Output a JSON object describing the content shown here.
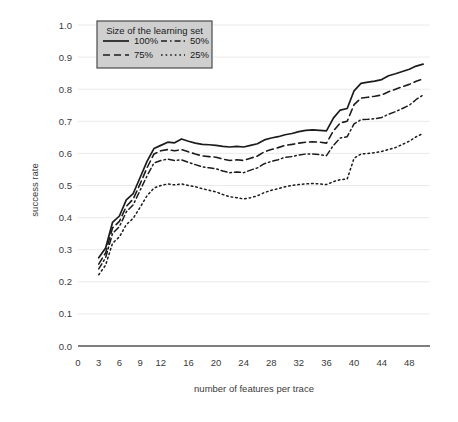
{
  "chart_data": {
    "type": "line",
    "title": "",
    "xlabel": "number of features per trace",
    "ylabel": "success rate",
    "xlim": [
      0,
      51
    ],
    "ylim": [
      0.0,
      1.0
    ],
    "grid": true,
    "legend_position": "top-left-inside",
    "legend_title": "Size of the learning set",
    "xtick_labels": [
      "0",
      "3",
      "6",
      "9",
      "12",
      "16",
      "20",
      "24",
      "28",
      "32",
      "36",
      "40",
      "44",
      "48"
    ],
    "xtick_values": [
      0,
      3,
      6,
      9,
      12,
      16,
      20,
      24,
      28,
      32,
      36,
      40,
      44,
      48
    ],
    "ytick_labels": [
      "0.0",
      "0.1",
      "0.2",
      "0.3",
      "0.4",
      "0.5",
      "0.6",
      "0.7",
      "0.8",
      "0.9",
      "1.0"
    ],
    "ytick_values": [
      0.0,
      0.1,
      0.2,
      0.3,
      0.4,
      0.5,
      0.6,
      0.7,
      0.8,
      0.9,
      1.0
    ],
    "x": [
      3,
      4,
      5,
      6,
      7,
      8,
      9,
      10,
      11,
      12,
      13,
      14,
      15,
      16,
      17,
      18,
      19,
      20,
      21,
      22,
      23,
      24,
      25,
      26,
      27,
      28,
      29,
      30,
      31,
      32,
      33,
      34,
      35,
      36,
      37,
      38,
      39,
      40,
      41,
      42,
      43,
      44,
      45,
      46,
      47,
      48,
      49,
      50
    ],
    "series": [
      {
        "name": "100%",
        "label": "100%",
        "dash": "solid",
        "linewidth": 1.7,
        "color": "#1c1c1c",
        "values": [
          0.275,
          0.305,
          0.385,
          0.405,
          0.455,
          0.475,
          0.525,
          0.575,
          0.615,
          0.625,
          0.635,
          0.633,
          0.645,
          0.638,
          0.632,
          0.628,
          0.627,
          0.625,
          0.622,
          0.62,
          0.622,
          0.62,
          0.625,
          0.63,
          0.642,
          0.648,
          0.652,
          0.658,
          0.662,
          0.668,
          0.672,
          0.673,
          0.672,
          0.67,
          0.71,
          0.735,
          0.74,
          0.795,
          0.818,
          0.822,
          0.825,
          0.83,
          0.842,
          0.848,
          0.855,
          0.862,
          0.872,
          0.878
        ]
      },
      {
        "name": "75%",
        "label": "75%",
        "dash": "dashed",
        "linewidth": 1.6,
        "color": "#1c1c1c",
        "values": [
          0.255,
          0.29,
          0.368,
          0.388,
          0.435,
          0.458,
          0.505,
          0.555,
          0.598,
          0.608,
          0.612,
          0.608,
          0.612,
          0.605,
          0.598,
          0.592,
          0.59,
          0.588,
          0.582,
          0.578,
          0.58,
          0.578,
          0.585,
          0.592,
          0.605,
          0.612,
          0.618,
          0.625,
          0.628,
          0.632,
          0.635,
          0.636,
          0.635,
          0.632,
          0.67,
          0.695,
          0.7,
          0.752,
          0.772,
          0.775,
          0.778,
          0.782,
          0.792,
          0.8,
          0.808,
          0.815,
          0.825,
          0.832
        ]
      },
      {
        "name": "50%",
        "label": "50%",
        "dash": "dashdot",
        "linewidth": 1.5,
        "color": "#1c1c1c",
        "values": [
          0.24,
          0.275,
          0.35,
          0.372,
          0.418,
          0.44,
          0.485,
          0.53,
          0.57,
          0.578,
          0.582,
          0.578,
          0.58,
          0.572,
          0.565,
          0.558,
          0.555,
          0.552,
          0.545,
          0.54,
          0.542,
          0.54,
          0.548,
          0.555,
          0.568,
          0.575,
          0.58,
          0.588,
          0.59,
          0.595,
          0.598,
          0.598,
          0.596,
          0.593,
          0.625,
          0.648,
          0.652,
          0.692,
          0.705,
          0.706,
          0.708,
          0.712,
          0.722,
          0.73,
          0.74,
          0.75,
          0.768,
          0.782
        ]
      },
      {
        "name": "25%",
        "label": "25%",
        "dash": "dotted",
        "linewidth": 1.5,
        "color": "#1c1c1c",
        "values": [
          0.222,
          0.252,
          0.32,
          0.34,
          0.378,
          0.398,
          0.432,
          0.468,
          0.492,
          0.5,
          0.505,
          0.502,
          0.505,
          0.5,
          0.496,
          0.49,
          0.485,
          0.48,
          0.472,
          0.465,
          0.462,
          0.458,
          0.462,
          0.468,
          0.478,
          0.485,
          0.49,
          0.496,
          0.5,
          0.503,
          0.505,
          0.506,
          0.505,
          0.503,
          0.512,
          0.518,
          0.52,
          0.585,
          0.598,
          0.6,
          0.602,
          0.606,
          0.612,
          0.618,
          0.628,
          0.638,
          0.652,
          0.662
        ]
      }
    ]
  }
}
